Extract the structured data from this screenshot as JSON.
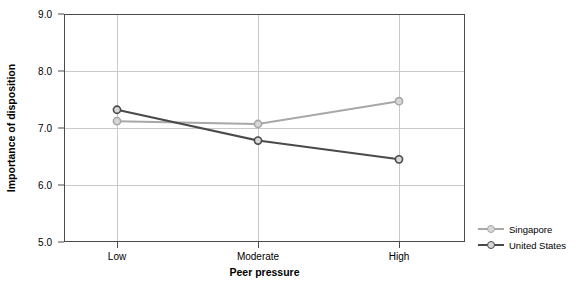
{
  "chart_data": {
    "type": "line",
    "title": "",
    "xlabel": "Peer pressure",
    "ylabel": "Importance of disposition",
    "categories": [
      "Low",
      "Moderate",
      "High"
    ],
    "ylim": [
      5.0,
      9.0
    ],
    "yticks": [
      "5.0",
      "6.0",
      "7.0",
      "8.0",
      "9.0"
    ],
    "ytick_values": [
      5.0,
      6.0,
      7.0,
      8.0,
      9.0
    ],
    "grid": true,
    "legend_position": "right",
    "series": [
      {
        "name": "Singapore",
        "color": "#a8a8a8",
        "values": [
          7.12,
          7.07,
          7.47
        ]
      },
      {
        "name": "United States",
        "color": "#4a4a4a",
        "values": [
          7.32,
          6.78,
          6.45
        ]
      }
    ]
  },
  "axis": {
    "y_title": "Importance of disposition",
    "x_title": "Peer pressure"
  },
  "legend": {
    "items": [
      {
        "label": "Singapore"
      },
      {
        "label": "United States"
      }
    ]
  }
}
